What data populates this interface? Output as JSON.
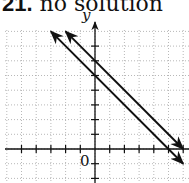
{
  "title": {
    "number": "21.",
    "text": "no solution"
  },
  "chart_data": {
    "type": "line",
    "title": "21. no solution",
    "xlabel": "",
    "ylabel": "y",
    "origin_label": "0",
    "xlim": [
      -6,
      6.3
    ],
    "ylim": [
      -2,
      8
    ],
    "grid": true,
    "series": [
      {
        "name": "line 1",
        "equation": "y = -x + 6",
        "points": [
          [
            -2,
            8
          ],
          [
            6,
            0
          ]
        ],
        "arrows": "both"
      },
      {
        "name": "line 2",
        "equation": "y = -x + 5",
        "points": [
          [
            -3,
            8
          ],
          [
            6,
            -1
          ]
        ],
        "arrows": "both"
      }
    ]
  }
}
